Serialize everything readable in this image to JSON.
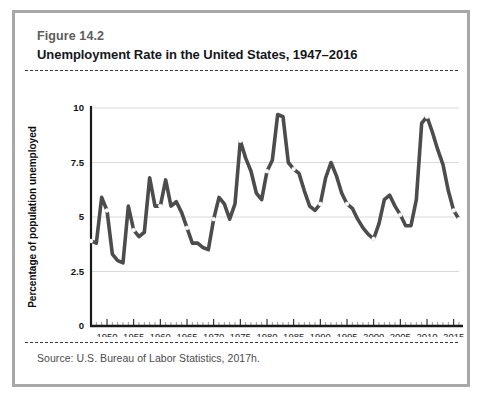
{
  "figure": {
    "number": "Figure 14.2",
    "title": "Unemployment Rate in the United States, 1947–2016",
    "source": "Source: U.S. Bureau of Labor Statistics, 2017h."
  },
  "colors": {
    "line": "#4c4c4c",
    "marker_fill": "#ffffff",
    "grid": "#d9d9d9",
    "axis": "#1a1a1a",
    "card_border": "#a8a8a8",
    "dashed_rule": "#3a3a3a",
    "title_text": "#15171a",
    "fig_number_text": "#5d5d5d",
    "source_text": "#4b4b4b"
  },
  "chart_data": {
    "type": "line",
    "title": "Unemployment Rate in the United States, 1947–2016",
    "xlabel": "",
    "ylabel": "Percentage of population unemployed",
    "xlim": [
      1947,
      2016
    ],
    "ylim": [
      0,
      10
    ],
    "yticks": [
      0,
      2.5,
      5,
      7.5,
      10
    ],
    "ytick_labels": [
      "0",
      "2.5",
      "5",
      "7.5",
      "10"
    ],
    "xticks": [
      1950,
      1955,
      1960,
      1965,
      1970,
      1975,
      1980,
      1985,
      1990,
      1995,
      2000,
      2005,
      2010,
      2015
    ],
    "xtick_labels": [
      "1950",
      "1955",
      "1960",
      "1965",
      "1970",
      "1975",
      "1980",
      "1985",
      "1990",
      "1995",
      "2000",
      "2005",
      "2010",
      "2015"
    ],
    "grid": true,
    "grid_axis": "y",
    "legend": false,
    "marker_years": [
      1950,
      1955,
      1960,
      1965,
      1970,
      1975,
      1980,
      1985,
      1990,
      1995,
      2000,
      2005,
      2010,
      2015
    ],
    "series": [
      {
        "name": "Unemployment rate",
        "x": [
          1947,
          1948,
          1949,
          1950,
          1951,
          1952,
          1953,
          1954,
          1955,
          1956,
          1957,
          1958,
          1959,
          1960,
          1961,
          1962,
          1963,
          1964,
          1965,
          1966,
          1967,
          1968,
          1969,
          1970,
          1971,
          1972,
          1973,
          1974,
          1975,
          1976,
          1977,
          1978,
          1979,
          1980,
          1981,
          1982,
          1983,
          1984,
          1985,
          1986,
          1987,
          1988,
          1989,
          1990,
          1991,
          1992,
          1993,
          1994,
          1995,
          1996,
          1997,
          1998,
          1999,
          2000,
          2001,
          2002,
          2003,
          2004,
          2005,
          2006,
          2007,
          2008,
          2009,
          2010,
          2011,
          2012,
          2013,
          2014,
          2015,
          2016
        ],
        "values": [
          3.9,
          3.8,
          5.9,
          5.3,
          3.3,
          3.0,
          2.9,
          5.5,
          4.4,
          4.1,
          4.3,
          6.8,
          5.5,
          5.5,
          6.7,
          5.5,
          5.7,
          5.2,
          4.5,
          3.8,
          3.8,
          3.6,
          3.5,
          4.9,
          5.9,
          5.6,
          4.9,
          5.6,
          8.5,
          7.7,
          7.1,
          6.1,
          5.8,
          7.1,
          7.6,
          9.7,
          9.6,
          7.5,
          7.2,
          7.0,
          6.2,
          5.5,
          5.3,
          5.6,
          6.8,
          7.5,
          6.9,
          6.1,
          5.6,
          5.4,
          4.9,
          4.5,
          4.2,
          4.0,
          4.7,
          5.8,
          6.0,
          5.5,
          5.1,
          4.6,
          4.6,
          5.8,
          9.3,
          9.6,
          8.9,
          8.1,
          7.4,
          6.2,
          5.3,
          4.9
        ]
      }
    ]
  }
}
